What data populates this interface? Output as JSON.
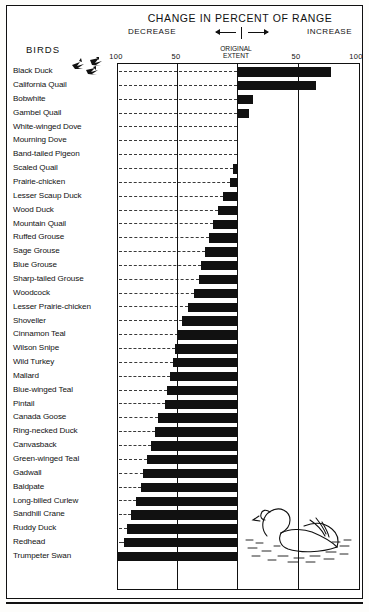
{
  "chart_data": {
    "type": "bar",
    "title": "CHANGE IN PERCENT OF RANGE",
    "xlabel": "",
    "ylabel": "BIRDS",
    "orientation": "horizontal",
    "xlim": [
      -100,
      100
    ],
    "grid": true,
    "axis_note_left": "DECREASE",
    "axis_note_right": "INCREASE",
    "origin_label_line1": "ORIGINAL",
    "origin_label_line2": "EXTENT",
    "tick_labels": [
      "100",
      "50",
      "50",
      "100"
    ],
    "tick_values": [
      -100,
      -50,
      50,
      100
    ],
    "categories": [
      "Black Duck",
      "California Quail",
      "Bobwhite",
      "Gambel Quail",
      "White-winged Dove",
      "Mourning Dove",
      "Band-tailed Pigeon",
      "Scaled Quail",
      "Prairie-chicken",
      "Lesser Scaup Duck",
      "Wood Duck",
      "Mountain Quail",
      "Ruffed Grouse",
      "Sage Grouse",
      "Blue Grouse",
      "Sharp-tailed Grouse",
      "Woodcock",
      "Lesser Prairie-chicken",
      "Shoveller",
      "Cinnamon Teal",
      "Wilson Snipe",
      "Wild Turkey",
      "Mallard",
      "Blue-winged Teal",
      "Pintail",
      "Canada Goose",
      "Ring-necked Duck",
      "Canvasback",
      "Green-winged Teal",
      "Gadwall",
      "Baldpate",
      "Long-billed Curlew",
      "Sandhill Crane",
      "Ruddy Duck",
      "Redhead",
      "Trumpeter Swan"
    ],
    "values": [
      78,
      66,
      13,
      10,
      0,
      0,
      0,
      -3,
      -6,
      -12,
      -16,
      -20,
      -23,
      -27,
      -30,
      -32,
      -36,
      -41,
      -46,
      -49,
      -52,
      -53,
      -56,
      -58,
      -60,
      -66,
      -68,
      -72,
      -75,
      -78,
      -80,
      -84,
      -88,
      -92,
      -94,
      -100
    ],
    "values_note": "Positive = increase in percent of range; negative = decrease"
  },
  "legend_label": "BIRDS",
  "decorations": {
    "flying_birds": "flying-birds-illustration",
    "swan": "swan-illustration"
  }
}
